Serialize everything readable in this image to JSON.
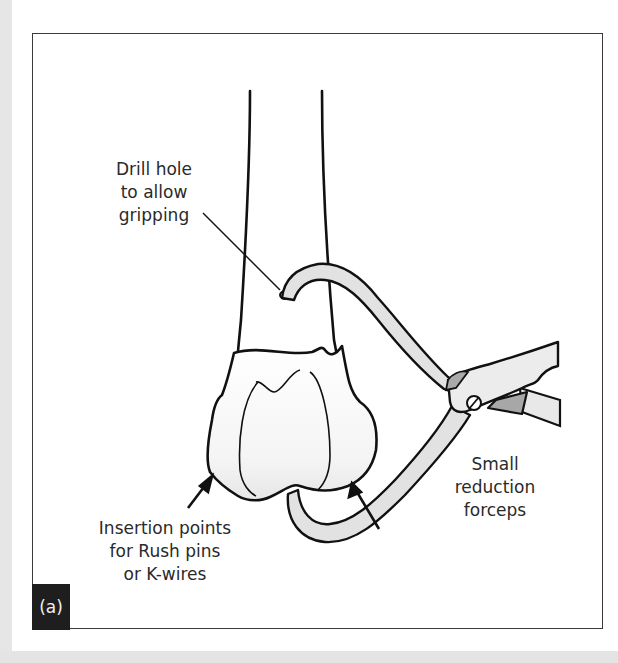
{
  "figure": {
    "panel_label": "(a)",
    "labels": {
      "drill_hole": [
        "Drill hole",
        "to allow",
        "gripping"
      ],
      "forceps": [
        "Small",
        "reduction",
        "forceps"
      ],
      "insertion": [
        "Insertion points",
        "for Rush pins",
        "or K-wires"
      ]
    },
    "colors": {
      "line": "#111111",
      "instrument_fill": "#e4e4e4",
      "hinge_fill": "#a9a9a9",
      "panel_tag_bg": "#1e1e1e",
      "frame_border": "#3a3a3a"
    }
  }
}
